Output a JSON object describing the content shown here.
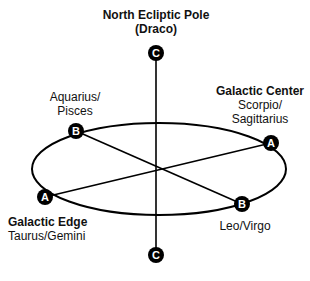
{
  "labels": {
    "north_pole_title": "North Ecliptic Pole",
    "north_pole_sub": "(Draco)",
    "aquarius_line1": "Aquarius/",
    "aquarius_line2": "Pisces",
    "galactic_center_title": "Galactic Center",
    "galactic_center_line1": "Scorpio/",
    "galactic_center_line2": "Sagittarius",
    "galactic_edge_title": "Galactic Edge",
    "galactic_edge_sub": "Taurus/Gemini",
    "leo_virgo": "Leo/Virgo"
  },
  "nodes": {
    "top_c": "C",
    "bottom_c": "C",
    "b_upper_left": "B",
    "b_lower_right": "B",
    "a_right": "A",
    "a_left": "A"
  },
  "colors": {
    "line": "#000000",
    "node_fill": "#000000",
    "node_text": "#ffffff",
    "background": "#ffffff"
  }
}
